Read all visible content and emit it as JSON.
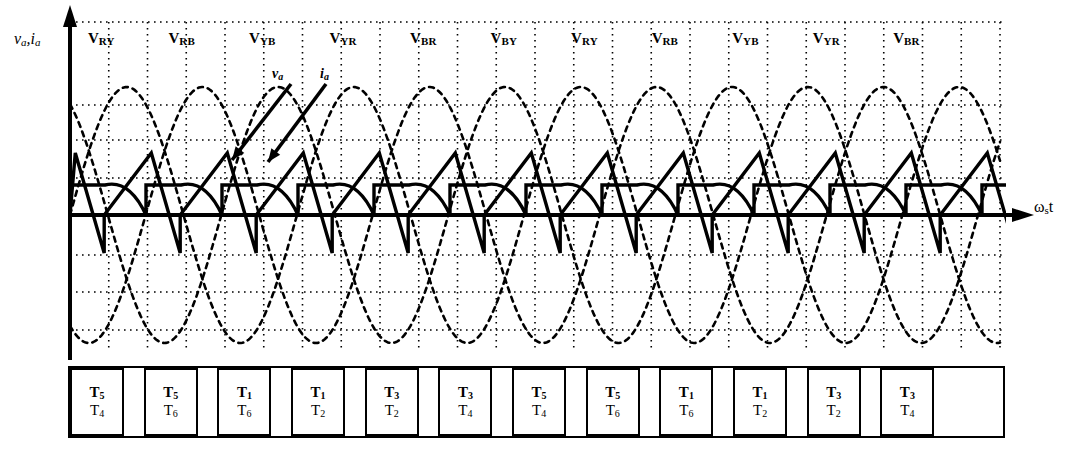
{
  "figure": {
    "type": "waveform-timing-diagram",
    "axes": {
      "y_label_v": "v",
      "y_label_v_sub": "a",
      "y_label_sep": ",",
      "y_label_i": "i",
      "y_label_i_sub": "a",
      "x_label_main": "ω",
      "x_label_sub": "s",
      "x_label_tail": "t"
    },
    "annotations": [
      {
        "name": "va-annotation",
        "text": "v",
        "sub": "a",
        "x": 272,
        "y": 66
      },
      {
        "name": "ia-annotation",
        "text": "i",
        "sub": "a",
        "x": 320,
        "y": 66
      }
    ],
    "interval_labels": [
      {
        "main": "V",
        "sub": "RY"
      },
      {
        "main": "V",
        "sub": "RB"
      },
      {
        "main": "V",
        "sub": "YB"
      },
      {
        "main": "V",
        "sub": "YR"
      },
      {
        "main": "V",
        "sub": "BR"
      },
      {
        "main": "V",
        "sub": "BY"
      },
      {
        "main": "V",
        "sub": "RY"
      },
      {
        "main": "V",
        "sub": "RB"
      },
      {
        "main": "V",
        "sub": "YB"
      },
      {
        "main": "V",
        "sub": "YR"
      },
      {
        "main": "V",
        "sub": "BR"
      }
    ],
    "conduction_table": [
      {
        "top": "T",
        "top_sub": "5",
        "bottom": "T",
        "bottom_sub": "4"
      },
      {
        "top": "T",
        "top_sub": "5",
        "bottom": "T",
        "bottom_sub": "6"
      },
      {
        "top": "T",
        "top_sub": "1",
        "bottom": "T",
        "bottom_sub": "6"
      },
      {
        "top": "T",
        "top_sub": "1",
        "bottom": "T",
        "bottom_sub": "2"
      },
      {
        "top": "T",
        "top_sub": "3",
        "bottom": "T",
        "bottom_sub": "2"
      },
      {
        "top": "T",
        "top_sub": "3",
        "bottom": "T",
        "bottom_sub": "4"
      },
      {
        "top": "T",
        "top_sub": "5",
        "bottom": "T",
        "bottom_sub": "4"
      },
      {
        "top": "T",
        "top_sub": "5",
        "bottom": "T",
        "bottom_sub": "6"
      },
      {
        "top": "T",
        "top_sub": "1",
        "bottom": "T",
        "bottom_sub": "6"
      },
      {
        "top": "T",
        "top_sub": "1",
        "bottom": "T",
        "bottom_sub": "2"
      },
      {
        "top": "T",
        "top_sub": "3",
        "bottom": "T",
        "bottom_sub": "2"
      },
      {
        "top": "T",
        "top_sub": "3",
        "bottom": "T",
        "bottom_sub": "4"
      }
    ],
    "colors": {
      "ink": "#000000",
      "background": "#ffffff"
    }
  },
  "chart_data": {
    "type": "line",
    "title": "",
    "xlabel": "ωs t",
    "ylabel": "va, ia",
    "grid": true,
    "legend": false,
    "axis_origin_px": {
      "x": 70,
      "y": 215
    },
    "plot_box_px": {
      "left": 70,
      "right": 1000,
      "top": 22,
      "bottom": 352
    },
    "vertical_gridline_count": 25,
    "horizontal_gridlines_y_px": [
      22,
      105,
      140,
      178,
      215,
      255,
      292,
      330
    ],
    "series": [
      {
        "name": "phase-R-supply",
        "style": "dashed",
        "type": "sine",
        "amplitude_px": 128,
        "period_px": 227,
        "phase_deg": 0
      },
      {
        "name": "phase-Y-supply",
        "style": "dashed",
        "type": "sine",
        "amplitude_px": 128,
        "period_px": 227,
        "phase_deg": -120
      },
      {
        "name": "phase-B-supply",
        "style": "dashed",
        "type": "sine",
        "amplitude_px": 128,
        "period_px": 227,
        "phase_deg": 120
      },
      {
        "name": "va-output-voltage",
        "style": "solid-bold",
        "type": "ramp-chop",
        "segment_width_px": 76,
        "peak_px": -62,
        "undershoot_px": 38
      },
      {
        "name": "ia-output-current",
        "style": "solid-bold",
        "type": "stepped-pulse",
        "segment_width_px": 76,
        "step_high_px": -30,
        "hump_peak_px": -36
      }
    ],
    "interval_boundaries_deg": [
      0,
      60,
      120,
      180,
      240,
      300,
      360,
      420,
      480,
      540,
      600,
      660
    ]
  }
}
